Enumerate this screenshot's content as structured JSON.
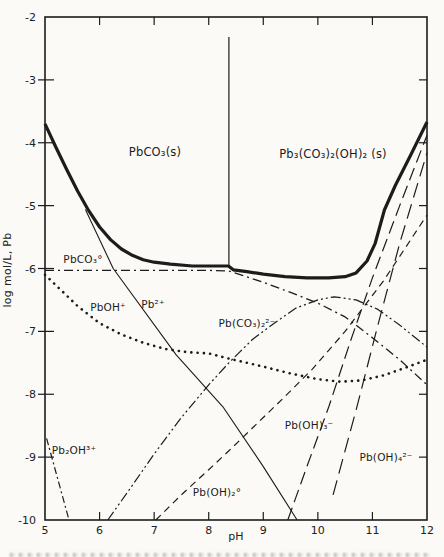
{
  "page": {
    "paper": "#fbfaf6",
    "ink": "#1c1c1c"
  },
  "chart_data": {
    "type": "line",
    "title": "",
    "xlabel": "pH",
    "ylabel": "log mol/L, Pb",
    "xlim": [
      5,
      12
    ],
    "ylim": [
      -10,
      -2
    ],
    "grid": false,
    "legend": "none (curves labeled inline)",
    "x_ticks": [
      5,
      6,
      7,
      8,
      9,
      10,
      11,
      12
    ],
    "y_ticks": [
      -2,
      -3,
      -4,
      -5,
      -6,
      -7,
      -8,
      -9,
      -10
    ],
    "labels": [
      {
        "id": "region-pbco3-solid",
        "text": "PbCO₃(s)",
        "px": 155,
        "py": 156,
        "fs": 11.5
      },
      {
        "id": "region-hydrocerussite",
        "text": "Pb₃(CO₃)₂(OH)₂ (s)",
        "px": 333,
        "py": 158,
        "fs": 11.5
      },
      {
        "id": "label-pbco3-aq",
        "text": "PbCO₃°",
        "px": 83,
        "py": 263,
        "fs": 10.5
      },
      {
        "id": "label-pboh",
        "text": "PbOH⁺",
        "px": 108,
        "py": 311,
        "fs": 10.5
      },
      {
        "id": "label-pb2",
        "text": "Pb²⁺",
        "px": 153,
        "py": 308,
        "fs": 10.5
      },
      {
        "id": "label-pbco32",
        "text": "Pb(CO₃)₂²⁻",
        "px": 247,
        "py": 327,
        "fs": 10.5
      },
      {
        "id": "label-pb2oh",
        "text": "Pb₂OH³⁺",
        "px": 74,
        "py": 454,
        "fs": 10.5
      },
      {
        "id": "label-pboh2",
        "text": "Pb(OH)₂°",
        "px": 217,
        "py": 496,
        "fs": 10.5
      },
      {
        "id": "label-pboh3",
        "text": "Pb(OH)₃⁻",
        "px": 309,
        "py": 429,
        "fs": 10.5
      },
      {
        "id": "label-pboh4",
        "text": "Pb(OH)₄²⁻",
        "px": 386,
        "py": 461,
        "fs": 10.5
      }
    ],
    "series": [
      {
        "id": "total-pb-envelope",
        "name": "total soluble Pb solubility envelope (thick curve)",
        "line": {
          "width": 3.2,
          "dash": ""
        },
        "points": [
          [
            5.0,
            -3.7
          ],
          [
            5.2,
            -4.07
          ],
          [
            5.4,
            -4.43
          ],
          [
            5.6,
            -4.77
          ],
          [
            5.8,
            -5.08
          ],
          [
            6.0,
            -5.34
          ],
          [
            6.2,
            -5.54
          ],
          [
            6.4,
            -5.69
          ],
          [
            6.6,
            -5.79
          ],
          [
            6.8,
            -5.86
          ],
          [
            7.0,
            -5.9
          ],
          [
            7.3,
            -5.93
          ],
          [
            7.7,
            -5.96
          ],
          [
            8.1,
            -5.96
          ],
          [
            8.36,
            -5.96
          ],
          [
            8.45,
            -6.02
          ],
          [
            8.7,
            -6.05
          ],
          [
            9.0,
            -6.09
          ],
          [
            9.4,
            -6.13
          ],
          [
            9.8,
            -6.15
          ],
          [
            10.2,
            -6.15
          ],
          [
            10.5,
            -6.13
          ],
          [
            10.7,
            -6.07
          ],
          [
            10.9,
            -5.88
          ],
          [
            11.05,
            -5.6
          ],
          [
            11.22,
            -5.07
          ],
          [
            11.42,
            -4.68
          ],
          [
            11.7,
            -4.2
          ],
          [
            12.0,
            -3.67
          ]
        ]
      },
      {
        "id": "phase-boundary",
        "name": "vertical boundary between PbCO3(s) and Pb3(CO3)2(OH)2(s) regions",
        "line": {
          "width": 1.2,
          "dash": ""
        },
        "points": [
          [
            8.37,
            -2.32
          ],
          [
            8.37,
            -5.96
          ]
        ]
      },
      {
        "id": "pb2",
        "name": "Pb²⁺",
        "line": {
          "width": 1.1,
          "dash": ""
        },
        "points": [
          [
            5.74,
            -5.06
          ],
          [
            6.25,
            -6.0
          ],
          [
            7.4,
            -7.37
          ],
          [
            8.26,
            -8.2
          ],
          [
            9.0,
            -9.15
          ],
          [
            9.62,
            -10.0
          ]
        ]
      },
      {
        "id": "pbco3-aq",
        "name": "PbCO₃°",
        "line": {
          "width": 1.3,
          "dash": "9 4 2 4"
        },
        "points": [
          [
            5.0,
            -6.03
          ],
          [
            6.0,
            -6.03
          ],
          [
            7.0,
            -6.03
          ],
          [
            8.0,
            -6.03
          ],
          [
            8.37,
            -6.04
          ],
          [
            9.0,
            -6.22
          ],
          [
            9.5,
            -6.38
          ],
          [
            10.0,
            -6.55
          ],
          [
            10.5,
            -6.77
          ],
          [
            11.0,
            -7.1
          ],
          [
            11.5,
            -7.45
          ],
          [
            12.0,
            -7.85
          ]
        ]
      },
      {
        "id": "pboh",
        "name": "PbOH⁺",
        "line": {
          "width": 2.6,
          "dash": "0.1 6.2",
          "cap": "round"
        },
        "points": [
          [
            5.0,
            -6.1
          ],
          [
            5.3,
            -6.35
          ],
          [
            5.6,
            -6.6
          ],
          [
            6.0,
            -6.87
          ],
          [
            6.4,
            -7.05
          ],
          [
            6.8,
            -7.18
          ],
          [
            7.2,
            -7.28
          ],
          [
            7.6,
            -7.33
          ],
          [
            8.0,
            -7.35
          ],
          [
            8.4,
            -7.44
          ],
          [
            9.0,
            -7.56
          ],
          [
            9.5,
            -7.67
          ],
          [
            10.0,
            -7.76
          ],
          [
            10.4,
            -7.8
          ],
          [
            10.8,
            -7.78
          ],
          [
            11.2,
            -7.7
          ],
          [
            11.6,
            -7.58
          ],
          [
            12.0,
            -7.45
          ]
        ]
      },
      {
        "id": "pb2oh",
        "name": "Pb₂OH³⁺",
        "line": {
          "width": 1.2,
          "dash": "7 3 2 3"
        },
        "points": [
          [
            5.03,
            -8.7
          ],
          [
            5.44,
            -10.0
          ]
        ]
      },
      {
        "id": "pbco32",
        "name": "Pb(CO₃)₂²⁻",
        "line": {
          "width": 1.2,
          "dash": "10 3 2 3 2 3"
        },
        "points": [
          [
            6.15,
            -10.0
          ],
          [
            6.6,
            -9.45
          ],
          [
            7.0,
            -8.95
          ],
          [
            7.5,
            -8.37
          ],
          [
            8.0,
            -7.85
          ],
          [
            8.37,
            -7.5
          ],
          [
            8.8,
            -7.13
          ],
          [
            9.2,
            -6.87
          ],
          [
            9.6,
            -6.63
          ],
          [
            10.0,
            -6.5
          ],
          [
            10.3,
            -6.45
          ],
          [
            10.7,
            -6.5
          ],
          [
            11.1,
            -6.65
          ],
          [
            11.5,
            -6.9
          ],
          [
            12.0,
            -7.25
          ]
        ]
      },
      {
        "id": "pboh2",
        "name": "Pb(OH)₂°",
        "line": {
          "width": 1.2,
          "dash": "7 5"
        },
        "points": [
          [
            7.03,
            -10.0
          ],
          [
            7.5,
            -9.6
          ],
          [
            8.0,
            -9.2
          ],
          [
            8.37,
            -8.9
          ],
          [
            9.0,
            -8.37
          ],
          [
            9.38,
            -8.05
          ],
          [
            9.9,
            -7.6
          ],
          [
            10.5,
            -7.0
          ],
          [
            11.2,
            -6.2
          ],
          [
            12.0,
            -5.15
          ]
        ]
      },
      {
        "id": "pboh3",
        "name": "Pb(OH)₃⁻",
        "line": {
          "width": 1.2,
          "dash": "13 6"
        },
        "points": [
          [
            9.45,
            -10.0
          ],
          [
            9.8,
            -9.15
          ],
          [
            10.2,
            -8.2
          ],
          [
            10.6,
            -7.15
          ],
          [
            11.0,
            -6.15
          ],
          [
            11.5,
            -5.0
          ],
          [
            12.0,
            -3.88
          ]
        ]
      },
      {
        "id": "pboh4",
        "name": "Pb(OH)₄²⁻",
        "line": {
          "width": 1.2,
          "dash": "15 7"
        },
        "points": [
          [
            10.28,
            -9.6
          ],
          [
            10.7,
            -8.25
          ],
          [
            11.1,
            -6.9
          ],
          [
            11.5,
            -5.6
          ],
          [
            12.0,
            -4.16
          ]
        ]
      }
    ]
  }
}
